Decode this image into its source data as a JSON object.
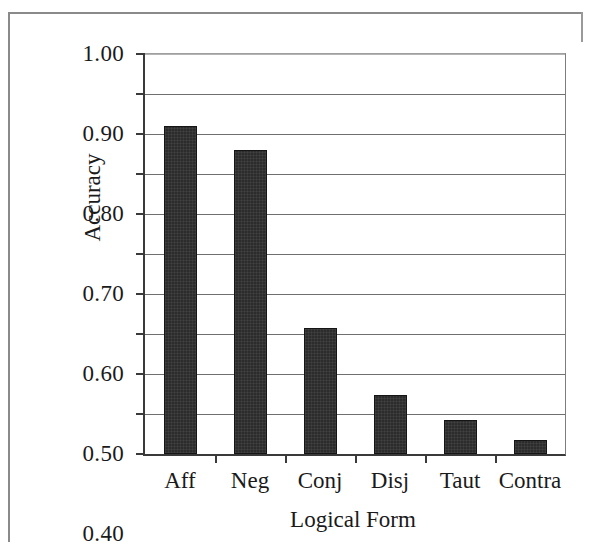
{
  "figure": {
    "background_color": "#ffffff",
    "bar_color": "#2c2c2c",
    "axis_color": "#3a3a3a",
    "gridline_color": "#6f6f6f",
    "frame_color": "#8a8a8a"
  },
  "chart_data": {
    "type": "bar",
    "title": "",
    "subtitle": "",
    "xlabel": "Logical Form",
    "ylabel": "Accuracy",
    "categories": [
      "Aff",
      "Neg",
      "Conj",
      "Disj",
      "Taut",
      "Contra"
    ],
    "values": [
      0.82,
      0.76,
      0.315,
      0.147,
      0.085,
      0.035
    ],
    "series": [
      {
        "name": "Accuracy",
        "values": [
          0.82,
          0.76,
          0.315,
          0.147,
          0.085,
          0.035
        ]
      }
    ],
    "ylim": [
      0.0,
      1.0
    ],
    "ytick_labels": [
      "1.00",
      "0.90",
      "0.80",
      "0.70",
      "0.60",
      "0.50",
      "0.40",
      "0.30",
      "0.20",
      "0.10",
      "0.00"
    ],
    "ytick_values": [
      1.0,
      0.9,
      0.8,
      0.7,
      0.6,
      0.5,
      0.4,
      0.3,
      0.2,
      0.1,
      0.0
    ],
    "ytick_interval": 0.1,
    "grid": true,
    "grid_axis": "y",
    "legend": false,
    "legend_position": "none",
    "annotations": []
  }
}
